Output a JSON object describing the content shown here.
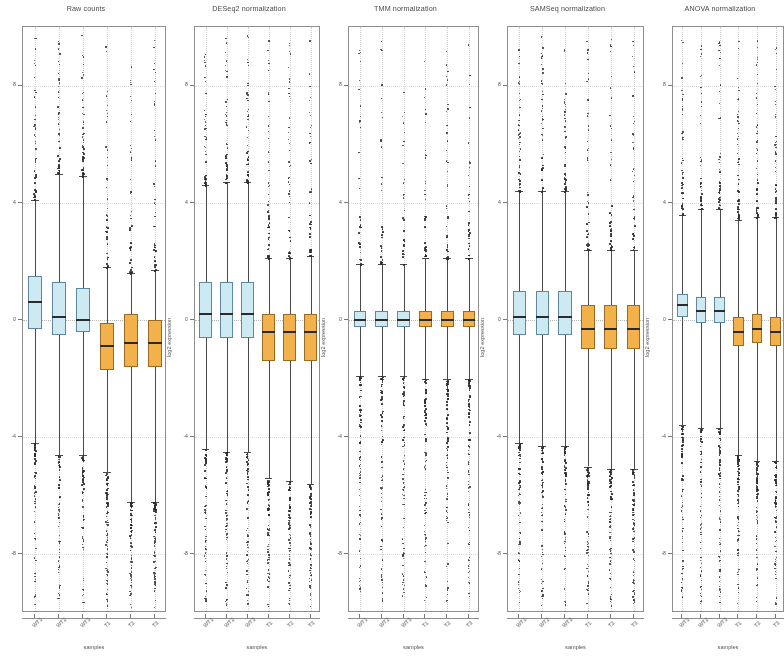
{
  "figure": {
    "xlabel": "samples",
    "ylabel": "log2 expression",
    "group_colors": {
      "wild_type": "#cdeaf2",
      "treated": "#f3b14b"
    },
    "sample_labels": [
      "WT1",
      "WT2",
      "WT3",
      "T1",
      "T2",
      "T3"
    ]
  },
  "chart_data": [
    {
      "type": "boxplot",
      "title": "Raw counts",
      "xlabel": "samples",
      "ylabel": "log2 expression",
      "categories": [
        "WT1",
        "WT2",
        "WT3",
        "T1",
        "T2",
        "T3"
      ],
      "group": [
        "wild_type",
        "wild_type",
        "wild_type",
        "treated",
        "treated",
        "treated"
      ],
      "ylim": [
        -10,
        10
      ],
      "yticks": [
        8,
        4,
        0,
        -4,
        -8
      ],
      "ytick_labels": [
        "8",
        "4",
        "0",
        "-4",
        "-8"
      ],
      "grid": true,
      "legend": "none",
      "boxes": [
        {
          "sample": "WT1",
          "lower_whisker": -4.2,
          "q1": -0.3,
          "median": 0.6,
          "q3": 1.5,
          "upper_whisker": 4.1,
          "n_outliers_high": 46,
          "n_outliers_low": 58
        },
        {
          "sample": "WT2",
          "lower_whisker": -4.6,
          "q1": -0.5,
          "median": 0.1,
          "q3": 1.3,
          "upper_whisker": 5.0,
          "n_outliers_high": 44,
          "n_outliers_low": 60
        },
        {
          "sample": "WT3",
          "lower_whisker": -4.6,
          "q1": -0.4,
          "median": 0.0,
          "q3": 1.1,
          "upper_whisker": 4.9,
          "n_outliers_high": 45,
          "n_outliers_low": 59
        },
        {
          "sample": "T1",
          "lower_whisker": -5.2,
          "q1": -1.7,
          "median": -0.9,
          "q3": -0.1,
          "upper_whisker": 1.8,
          "n_outliers_high": 40,
          "n_outliers_low": 70
        },
        {
          "sample": "T2",
          "lower_whisker": -6.2,
          "q1": -1.6,
          "median": -0.8,
          "q3": 0.2,
          "upper_whisker": 1.6,
          "n_outliers_high": 42,
          "n_outliers_low": 72
        },
        {
          "sample": "T3",
          "lower_whisker": -6.2,
          "q1": -1.6,
          "median": -0.8,
          "q3": 0.0,
          "upper_whisker": 1.7,
          "n_outliers_high": 41,
          "n_outliers_low": 71
        }
      ]
    },
    {
      "type": "boxplot",
      "title": "DESeq2 normalization",
      "xlabel": "samples",
      "ylabel": "log2 expression",
      "categories": [
        "WT1",
        "WT2",
        "WT3",
        "T1",
        "T2",
        "T3"
      ],
      "group": [
        "wild_type",
        "wild_type",
        "wild_type",
        "treated",
        "treated",
        "treated"
      ],
      "ylim": [
        -10,
        10
      ],
      "yticks": [
        8,
        4,
        0,
        -4,
        -8
      ],
      "ytick_labels": [
        "8",
        "4",
        "0",
        "-4",
        "-8"
      ],
      "grid": true,
      "legend": "none",
      "boxes": [
        {
          "sample": "WT1",
          "lower_whisker": -4.4,
          "q1": -0.6,
          "median": 0.2,
          "q3": 1.3,
          "upper_whisker": 4.6,
          "n_outliers_high": 45,
          "n_outliers_low": 60
        },
        {
          "sample": "WT2",
          "lower_whisker": -4.5,
          "q1": -0.6,
          "median": 0.2,
          "q3": 1.3,
          "upper_whisker": 4.7,
          "n_outliers_high": 45,
          "n_outliers_low": 60
        },
        {
          "sample": "WT3",
          "lower_whisker": -4.5,
          "q1": -0.6,
          "median": 0.2,
          "q3": 1.3,
          "upper_whisker": 4.7,
          "n_outliers_high": 45,
          "n_outliers_low": 60
        },
        {
          "sample": "T1",
          "lower_whisker": -5.4,
          "q1": -1.4,
          "median": -0.4,
          "q3": 0.2,
          "upper_whisker": 2.1,
          "n_outliers_high": 42,
          "n_outliers_low": 70
        },
        {
          "sample": "T2",
          "lower_whisker": -5.5,
          "q1": -1.4,
          "median": -0.4,
          "q3": 0.2,
          "upper_whisker": 2.1,
          "n_outliers_high": 42,
          "n_outliers_low": 70
        },
        {
          "sample": "T3",
          "lower_whisker": -5.6,
          "q1": -1.4,
          "median": -0.4,
          "q3": 0.2,
          "upper_whisker": 2.2,
          "n_outliers_high": 42,
          "n_outliers_low": 71
        }
      ]
    },
    {
      "type": "boxplot",
      "title": "TMM normalization",
      "xlabel": "samples",
      "ylabel": "log2 expression",
      "categories": [
        "WT1",
        "WT2",
        "WT3",
        "T1",
        "T2",
        "T3"
      ],
      "group": [
        "wild_type",
        "wild_type",
        "wild_type",
        "treated",
        "treated",
        "treated"
      ],
      "ylim": [
        -10,
        10
      ],
      "yticks": [
        8,
        4,
        0,
        -4,
        -8
      ],
      "ytick_labels": [
        "8",
        "4",
        "0",
        "-4",
        "-8"
      ],
      "grid": true,
      "legend": "none",
      "boxes": [
        {
          "sample": "WT1",
          "lower_whisker": -1.9,
          "q1": -0.25,
          "median": 0.0,
          "q3": 0.3,
          "upper_whisker": 1.9,
          "n_outliers_high": 30,
          "n_outliers_low": 70
        },
        {
          "sample": "WT2",
          "lower_whisker": -1.9,
          "q1": -0.25,
          "median": 0.0,
          "q3": 0.3,
          "upper_whisker": 1.9,
          "n_outliers_high": 30,
          "n_outliers_low": 70
        },
        {
          "sample": "WT3",
          "lower_whisker": -1.9,
          "q1": -0.25,
          "median": 0.0,
          "q3": 0.3,
          "upper_whisker": 1.9,
          "n_outliers_high": 30,
          "n_outliers_low": 70
        },
        {
          "sample": "T1",
          "lower_whisker": -2.0,
          "q1": -0.25,
          "median": 0.0,
          "q3": 0.3,
          "upper_whisker": 2.1,
          "n_outliers_high": 34,
          "n_outliers_low": 82
        },
        {
          "sample": "T2",
          "lower_whisker": -2.0,
          "q1": -0.25,
          "median": 0.0,
          "q3": 0.3,
          "upper_whisker": 2.1,
          "n_outliers_high": 34,
          "n_outliers_low": 82
        },
        {
          "sample": "T3",
          "lower_whisker": -2.0,
          "q1": -0.25,
          "median": 0.0,
          "q3": 0.3,
          "upper_whisker": 2.1,
          "n_outliers_high": 33,
          "n_outliers_low": 80
        }
      ]
    },
    {
      "type": "boxplot",
      "title": "SAMSeq normalization",
      "xlabel": "samples",
      "ylabel": "log2 expression",
      "categories": [
        "WT1",
        "WT2",
        "WT3",
        "T1",
        "T2",
        "T3"
      ],
      "group": [
        "wild_type",
        "wild_type",
        "wild_type",
        "treated",
        "treated",
        "treated"
      ],
      "ylim": [
        -10,
        10
      ],
      "yticks": [
        8,
        4,
        0,
        -4,
        -8
      ],
      "ytick_labels": [
        "8",
        "4",
        "0",
        "-4",
        "-8"
      ],
      "grid": true,
      "legend": "none",
      "boxes": [
        {
          "sample": "WT1",
          "lower_whisker": -4.2,
          "q1": -0.5,
          "median": 0.1,
          "q3": 1.0,
          "upper_whisker": 4.4,
          "n_outliers_high": 44,
          "n_outliers_low": 62
        },
        {
          "sample": "WT2",
          "lower_whisker": -4.3,
          "q1": -0.5,
          "median": 0.1,
          "q3": 1.0,
          "upper_whisker": 4.4,
          "n_outliers_high": 44,
          "n_outliers_low": 62
        },
        {
          "sample": "WT3",
          "lower_whisker": -4.3,
          "q1": -0.5,
          "median": 0.1,
          "q3": 1.0,
          "upper_whisker": 4.4,
          "n_outliers_high": 44,
          "n_outliers_low": 62
        },
        {
          "sample": "T1",
          "lower_whisker": -5.0,
          "q1": -1.0,
          "median": -0.3,
          "q3": 0.5,
          "upper_whisker": 2.4,
          "n_outliers_high": 42,
          "n_outliers_low": 72
        },
        {
          "sample": "T2",
          "lower_whisker": -5.1,
          "q1": -1.0,
          "median": -0.3,
          "q3": 0.5,
          "upper_whisker": 2.4,
          "n_outliers_high": 42,
          "n_outliers_low": 72
        },
        {
          "sample": "T3",
          "lower_whisker": -5.1,
          "q1": -1.0,
          "median": -0.3,
          "q3": 0.5,
          "upper_whisker": 2.4,
          "n_outliers_high": 42,
          "n_outliers_low": 72
        }
      ]
    },
    {
      "type": "boxplot",
      "title": "ANOVA normalization",
      "xlabel": "samples",
      "ylabel": "log2 expression",
      "categories": [
        "WT1",
        "WT2",
        "WT3",
        "T1",
        "T2",
        "T3"
      ],
      "group": [
        "wild_type",
        "wild_type",
        "wild_type",
        "treated",
        "treated",
        "treated"
      ],
      "ylim": [
        -10,
        10
      ],
      "yticks": [
        8,
        4,
        0,
        -4,
        -8
      ],
      "ytick_labels": [
        "8",
        "4",
        "0",
        "-4",
        "-8"
      ],
      "grid": true,
      "legend": "none",
      "boxes": [
        {
          "sample": "WT1",
          "lower_whisker": -3.6,
          "q1": 0.1,
          "median": 0.5,
          "q3": 0.9,
          "upper_whisker": 3.6,
          "n_outliers_high": 40,
          "n_outliers_low": 64
        },
        {
          "sample": "WT2",
          "lower_whisker": -3.7,
          "q1": -0.1,
          "median": 0.3,
          "q3": 0.8,
          "upper_whisker": 3.8,
          "n_outliers_high": 40,
          "n_outliers_low": 64
        },
        {
          "sample": "WT3",
          "lower_whisker": -3.7,
          "q1": -0.1,
          "median": 0.3,
          "q3": 0.8,
          "upper_whisker": 3.8,
          "n_outliers_high": 40,
          "n_outliers_low": 64
        },
        {
          "sample": "T1",
          "lower_whisker": -4.6,
          "q1": -0.9,
          "median": -0.4,
          "q3": 0.1,
          "upper_whisker": 3.4,
          "n_outliers_high": 46,
          "n_outliers_low": 70
        },
        {
          "sample": "T2",
          "lower_whisker": -4.8,
          "q1": -0.8,
          "median": -0.3,
          "q3": 0.2,
          "upper_whisker": 3.5,
          "n_outliers_high": 46,
          "n_outliers_low": 70
        },
        {
          "sample": "T3",
          "lower_whisker": -4.8,
          "q1": -0.9,
          "median": -0.4,
          "q3": 0.1,
          "upper_whisker": 3.5,
          "n_outliers_high": 46,
          "n_outliers_low": 70
        }
      ]
    }
  ]
}
